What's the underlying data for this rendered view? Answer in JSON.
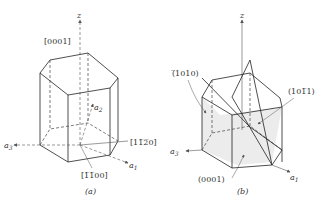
{
  "figure_a": {
    "caption": "(a)",
    "z_axis": "z",
    "a1": "a",
    "a1_sub": "1",
    "a2": "a",
    "a2_sub": "2",
    "a3": "a",
    "a3_sub": "3",
    "dir_0001": "[0001]",
    "dir_11-20": "[11̅2̅0]",
    "dir_1-100": "[1̅1̅00]"
  },
  "figure_b": {
    "caption": "(b)",
    "z_axis": "z",
    "a1": "a",
    "a1_sub": "1",
    "a3": "a",
    "a3_sub": "3",
    "plane_-1010": "(̅1010)",
    "plane_10-11": "(101̅1)",
    "plane_0001": "(0001)"
  }
}
